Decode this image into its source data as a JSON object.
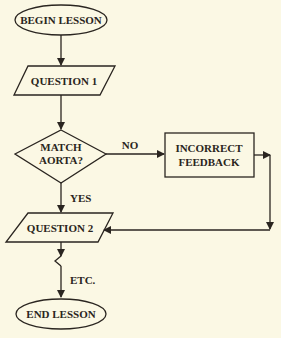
{
  "diagram": {
    "type": "flowchart",
    "nodes": {
      "begin": {
        "label": "BEGIN LESSON",
        "shape": "terminator"
      },
      "q1": {
        "label": "QUESTION 1",
        "shape": "input-output"
      },
      "decision": {
        "line1": "MATCH",
        "line2": "AORTA?",
        "shape": "decision"
      },
      "feedback": {
        "line1": "INCORRECT",
        "line2": "FEEDBACK",
        "shape": "process"
      },
      "q2": {
        "label": "QUESTION 2",
        "shape": "input-output"
      },
      "end": {
        "label": "END LESSON",
        "shape": "terminator"
      }
    },
    "edges": {
      "no": "NO",
      "yes": "YES",
      "etc": "ETC."
    },
    "colors": {
      "stroke": "#2a2520",
      "background": "#fbf8e4"
    }
  }
}
